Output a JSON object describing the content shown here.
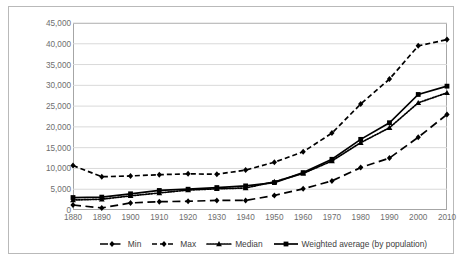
{
  "chart_data": {
    "type": "line",
    "title": "",
    "subtitle": "",
    "xlabel": "",
    "ylabel": "",
    "grid": true,
    "legend_position": "bottom",
    "xlim": [
      1880,
      2010
    ],
    "ylim": [
      0,
      45000
    ],
    "ytick_values": [
      0,
      5000,
      10000,
      15000,
      20000,
      25000,
      30000,
      35000,
      40000,
      45000
    ],
    "ytick_labels": [
      "0",
      "5,000",
      "10,000",
      "15,000",
      "20,000",
      "25,000",
      "30,000",
      "35,000",
      "40,000",
      "45,000"
    ],
    "categories": [
      1880,
      1890,
      1900,
      1910,
      1920,
      1930,
      1940,
      1950,
      1960,
      1970,
      1980,
      1990,
      2000,
      2010
    ],
    "xtick_labels": [
      "1880",
      "1890",
      "1900",
      "1910",
      "1920",
      "1930",
      "1940",
      "1950",
      "1960",
      "1970",
      "1980",
      "1990",
      "2000",
      "2010"
    ],
    "series": [
      {
        "name": "Min",
        "label": "Min",
        "dash": "long-dash",
        "marker": "diamond",
        "color": "#000000",
        "values": [
          1200,
          500,
          1700,
          2000,
          2100,
          2300,
          2300,
          3500,
          5100,
          7000,
          10200,
          12500,
          17500,
          23000
        ]
      },
      {
        "name": "Max",
        "label": "Max",
        "dash": "dash",
        "marker": "diamond",
        "color": "#000000",
        "values": [
          10700,
          8000,
          8200,
          8500,
          8700,
          8600,
          9600,
          11500,
          14000,
          18500,
          25500,
          31500,
          39500,
          41000
        ]
      },
      {
        "name": "Median",
        "label": "Median",
        "dash": "dotted",
        "marker": "triangle",
        "color": "#000000",
        "values": [
          2400,
          2600,
          3400,
          4100,
          4800,
          5100,
          5300,
          6800,
          8800,
          11800,
          16200,
          19800,
          25800,
          28200
        ]
      },
      {
        "name": "Weighted average (by population)",
        "label": "Weighted average (by population)",
        "dash": "solid",
        "marker": "square",
        "color": "#000000",
        "values": [
          3000,
          3100,
          3900,
          4700,
          5000,
          5400,
          5800,
          6600,
          9000,
          12200,
          17000,
          21000,
          27800,
          29800
        ]
      }
    ]
  }
}
